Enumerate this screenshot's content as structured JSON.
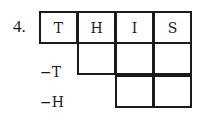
{
  "problem": {
    "number": "4.",
    "word": [
      "T",
      "H",
      "I",
      "S"
    ],
    "rows": [
      {
        "label": "",
        "cells": [
          "T",
          "H",
          "I",
          "S"
        ],
        "start_col": 0
      },
      {
        "label": "−T",
        "cells": [
          "",
          "",
          ""
        ],
        "start_col": 1
      },
      {
        "label": "−H",
        "cells": [
          "",
          ""
        ],
        "start_col": 2
      }
    ]
  }
}
